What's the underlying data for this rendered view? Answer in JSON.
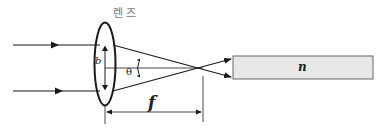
{
  "diagram": {
    "lens_label": "렌 즈",
    "aperture_label": "b",
    "angle_label": "θ",
    "focal_length_label": "f",
    "medium_label": "n",
    "colors": {
      "line": "#1a1a1a",
      "medium_fill": "#e8e8e8",
      "medium_border": "#666666",
      "lens_label": "#777777"
    }
  }
}
